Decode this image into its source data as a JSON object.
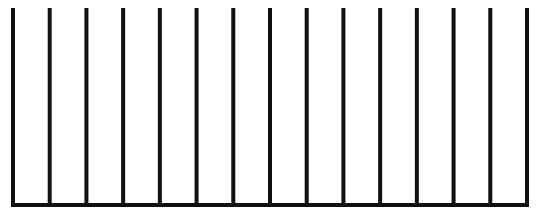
{
  "diagram": {
    "type": "comb",
    "stroke_color": "#111111",
    "background_color": "#ffffff",
    "stroke_width": 4,
    "vertical_line_count": 15,
    "first_line_x": 13,
    "last_line_x": 527,
    "line_top_y": 8,
    "baseline_y": 205
  }
}
